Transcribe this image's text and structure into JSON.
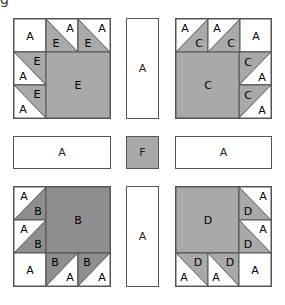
{
  "figure": {
    "corner_glyph": "g",
    "colors": {
      "A": "#ffffff",
      "B": "#8e8e8e",
      "C": "#a9a9a9",
      "D": "#a9a9a9",
      "E": "#a9a9a9",
      "F": "#a9a9a9",
      "line": "#555555"
    },
    "blocks": {
      "top_left": {
        "fabric": "E",
        "corner_square": "A",
        "large_square": "E",
        "hst_top": [
          {
            "white": "A",
            "gray": "E"
          },
          {
            "white": "A",
            "gray": "E"
          }
        ],
        "hst_side": [
          {
            "white": "A",
            "gray": "E"
          },
          {
            "white": "A",
            "gray": "E"
          }
        ]
      },
      "top_right": {
        "fabric": "C",
        "corner_square": "A",
        "large_square": "C",
        "hst_top": [
          {
            "white": "A",
            "gray": "C"
          },
          {
            "white": "A",
            "gray": "C"
          }
        ],
        "hst_side": [
          {
            "white": "A",
            "gray": "C"
          },
          {
            "white": "A",
            "gray": "C"
          }
        ]
      },
      "bottom_left": {
        "fabric": "B",
        "corner_square": "A",
        "large_square": "B",
        "hst_side": [
          {
            "white": "A",
            "gray": "B"
          },
          {
            "white": "A",
            "gray": "B"
          }
        ],
        "hst_bottom": [
          {
            "white": "A",
            "gray": "B"
          },
          {
            "white": "A",
            "gray": "B"
          }
        ]
      },
      "bottom_right": {
        "fabric": "D",
        "corner_square": "A",
        "large_square": "D",
        "hst_side": [
          {
            "white": "A",
            "gray": "D"
          },
          {
            "white": "A",
            "gray": "D"
          }
        ],
        "hst_bottom": [
          {
            "white": "A",
            "gray": "D"
          },
          {
            "white": "A",
            "gray": "D"
          }
        ]
      }
    },
    "sashing": {
      "top_vertical": "A",
      "left_horizontal": "A",
      "center_square": "F",
      "right_horizontal": "A",
      "bottom_vertical": "A"
    }
  }
}
